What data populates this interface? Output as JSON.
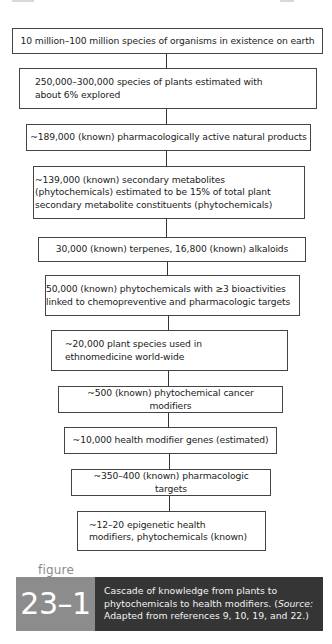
{
  "diagram": {
    "type": "flowchart-cascade",
    "direction": "top-to-bottom",
    "boxes": [
      {
        "id": 1,
        "text": "10 million–100 million species of organisms in existence on earth"
      },
      {
        "id": 2,
        "text": "250,000–300,000 species of plants estimated with about 6% explored"
      },
      {
        "id": 3,
        "text": "~189,000 (known) pharmacologically active natural products"
      },
      {
        "id": 4,
        "text": "~139,000 (known) secondary metabolites (phytochemicals) estimated to be 15% of total plant secondary metabolite constituents (phytochemicals)"
      },
      {
        "id": 5,
        "text": "30,000 (known) terpenes, 16,800 (known) alkaloids"
      },
      {
        "id": 6,
        "text": "50,000 (known) phytochemicals with ≥3 bioactivities linked to chemopreventive and pharmacologic targets"
      },
      {
        "id": 7,
        "text": "~20,000 plant species used in ethnomedicine world-wide"
      },
      {
        "id": 8,
        "text": "~500 (known) phytochemical cancer modifiers"
      },
      {
        "id": 9,
        "text": "~10,000 health modifier genes (estimated)"
      },
      {
        "id": 10,
        "text": "~350–400 (known) pharmacologic targets"
      },
      {
        "id": 11,
        "text": "~12–20 epigenetic health modifiers, phytochemicals (known)"
      }
    ],
    "edges": [
      [
        1,
        2
      ],
      [
        2,
        3
      ],
      [
        3,
        4
      ],
      [
        4,
        5
      ],
      [
        5,
        6
      ],
      [
        6,
        7
      ],
      [
        7,
        8
      ],
      [
        8,
        9
      ],
      [
        9,
        10
      ],
      [
        10,
        11
      ]
    ]
  },
  "caption": {
    "label": "figure",
    "number": "23–1",
    "text_main": "Cascade of knowledge from plants to phytochemicals to health modifiers. (",
    "text_source_label": "Source:",
    "text_source": " Adapted from references 9, 10, 19, and 22.)",
    "colors": {
      "number_block": "#8c8c8c",
      "text_block": "#353535"
    }
  }
}
